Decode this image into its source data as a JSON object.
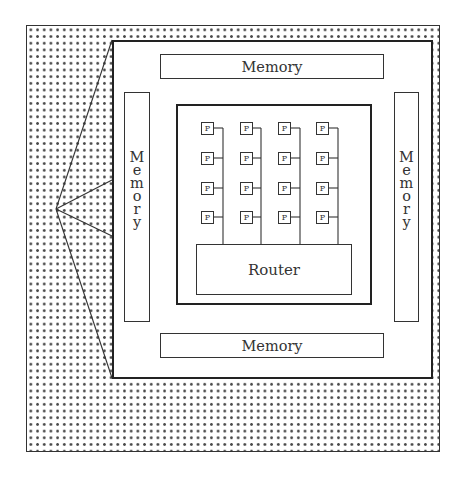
{
  "diagram": {
    "title": "",
    "memory_top": {
      "label": "Memory"
    },
    "memory_bottom": {
      "label": "Memory"
    },
    "memory_left": {
      "label": "Memory",
      "letters": [
        "M",
        "e",
        "m",
        "o",
        "r",
        "y"
      ]
    },
    "memory_right": {
      "label": "Memory",
      "letters": [
        "M",
        "e",
        "m",
        "o",
        "r",
        "y"
      ]
    },
    "router": {
      "label": "Router"
    },
    "processor_label": "P",
    "processor_grid": {
      "rows": 4,
      "cols": 4
    },
    "processors": [
      {
        "row": 0,
        "col": 0,
        "label": "P"
      },
      {
        "row": 0,
        "col": 1,
        "label": "P"
      },
      {
        "row": 0,
        "col": 2,
        "label": "P"
      },
      {
        "row": 0,
        "col": 3,
        "label": "P"
      },
      {
        "row": 1,
        "col": 0,
        "label": "P"
      },
      {
        "row": 1,
        "col": 1,
        "label": "P"
      },
      {
        "row": 1,
        "col": 2,
        "label": "P"
      },
      {
        "row": 1,
        "col": 3,
        "label": "P"
      },
      {
        "row": 2,
        "col": 0,
        "label": "P"
      },
      {
        "row": 2,
        "col": 1,
        "label": "P"
      },
      {
        "row": 2,
        "col": 2,
        "label": "P"
      },
      {
        "row": 2,
        "col": 3,
        "label": "P"
      },
      {
        "row": 3,
        "col": 0,
        "label": "P"
      },
      {
        "row": 3,
        "col": 1,
        "label": "P"
      },
      {
        "row": 3,
        "col": 2,
        "label": "P"
      },
      {
        "row": 3,
        "col": 3,
        "label": "P"
      }
    ],
    "outer_pattern": "dotted-grid",
    "zoom_fan_lines": 4
  }
}
